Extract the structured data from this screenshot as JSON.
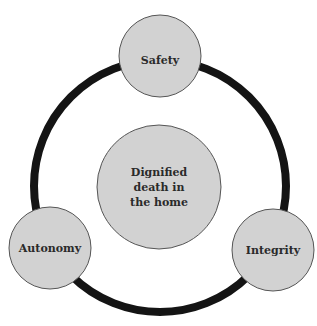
{
  "diagram": {
    "type": "cycle",
    "ring": {
      "stroke": "#141414",
      "stroke_width": 8
    },
    "node_fill": "#d2d2d2",
    "node_stroke": "#555555",
    "center": {
      "lines": [
        "Dignified",
        "death in",
        "the home"
      ]
    },
    "nodes": [
      {
        "id": "safety",
        "label": "Safety"
      },
      {
        "id": "autonomy",
        "label": "Autonomy"
      },
      {
        "id": "integrity",
        "label": "Integrity"
      }
    ]
  }
}
